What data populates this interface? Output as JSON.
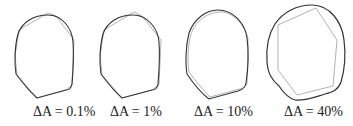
{
  "figure": {
    "colors": {
      "reference_outline": "#333333",
      "approximation_outline": "#aaaaaa",
      "label_text": "#222222",
      "background": "#ffffff"
    },
    "panels": [
      {
        "label": "ΔA = 0.1%",
        "area_error_percent": 0.1
      },
      {
        "label": "ΔA = 1%",
        "area_error_percent": 1
      },
      {
        "label": "ΔA = 10%",
        "area_error_percent": 10
      },
      {
        "label": "ΔA = 40%",
        "area_error_percent": 40
      }
    ]
  }
}
